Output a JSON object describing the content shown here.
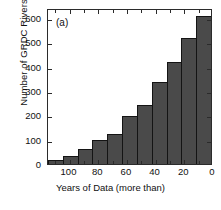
{
  "chart_data": {
    "type": "bar",
    "title": "",
    "panel_label": "(a)",
    "xlabel": "Years of Data (more than)",
    "ylabel": "Number of GRDC Rivers",
    "categories": [
      "110",
      "100",
      "90",
      "80",
      "70",
      "60",
      "50",
      "40",
      "30",
      "20",
      "10"
    ],
    "values": [
      15,
      33,
      60,
      97,
      123,
      196,
      241,
      337,
      419,
      519,
      609
    ],
    "bar_centers_x": [
      110,
      100,
      90,
      80,
      70,
      60,
      50,
      40,
      30,
      20,
      10
    ],
    "xlim": [
      115,
      0
    ],
    "ylim": [
      0,
      640
    ],
    "xticks": [
      "100",
      "80",
      "60",
      "40",
      "20",
      "0"
    ],
    "xtick_values": [
      100,
      80,
      60,
      40,
      20,
      0
    ],
    "yticks": [
      "0",
      "100",
      "200",
      "300",
      "400",
      "500",
      "600"
    ],
    "ytick_values": [
      0,
      100,
      200,
      300,
      400,
      500,
      600
    ],
    "x_axis_reversed": true,
    "grid": false,
    "legend": "none",
    "bar_fill_color": "#4a4a4a",
    "bar_edge_color": "#141414",
    "axis_color": "#2b2b2b",
    "background_color": "#ffffff"
  },
  "figure": {
    "panel_label": "(a)"
  }
}
